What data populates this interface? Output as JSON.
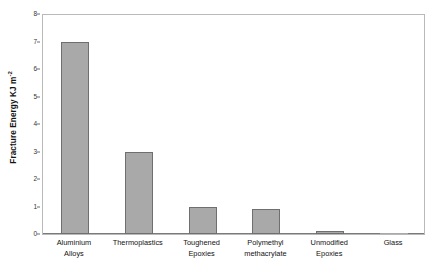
{
  "chart_data": {
    "type": "bar",
    "title": "",
    "xlabel": "",
    "ylabel": "Fracture Energy KJ m",
    "ylabel_superscript": "-2",
    "ylim": [
      0,
      8
    ],
    "yticks": [
      0,
      1,
      2,
      3,
      4,
      5,
      6,
      7,
      8
    ],
    "ytick_labels": [
      "0",
      "1",
      "2",
      "3",
      "4",
      "5",
      "6",
      "7",
      "8"
    ],
    "grid": false,
    "legend": null,
    "bar_color": "#a9a9a9",
    "bar_edge_color": "#6f6f6f",
    "categories": [
      "Aluminium Alloys",
      "Thermoplastics",
      "Toughened Epoxies",
      "Polymethyl methacrylate",
      "Unmodified Epoxies",
      "Glass"
    ],
    "category_lines": [
      [
        "Aluminium",
        "Alloys"
      ],
      [
        "Thermoplastics",
        ""
      ],
      [
        "Toughened",
        "Epoxies"
      ],
      [
        "Polymethyl",
        "methacrylate"
      ],
      [
        "Unmodified",
        "Epoxies"
      ],
      [
        "Glass",
        ""
      ]
    ],
    "values": [
      7.0,
      3.0,
      1.0,
      0.9,
      0.12,
      0.0
    ]
  }
}
